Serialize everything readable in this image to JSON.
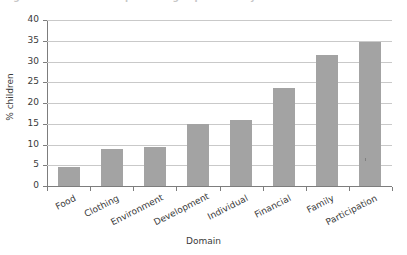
{
  "caption": {
    "text": "Figure: % of children experiencing deprivation by domain"
  },
  "chart_data": {
    "type": "bar",
    "title": "",
    "xlabel": "Domain",
    "ylabel": "% children",
    "categories": [
      "Food",
      "Clothing",
      "Environment",
      "Development",
      "Individual",
      "Financial",
      "Family",
      "Participation"
    ],
    "values": [
      4.5,
      9.0,
      9.3,
      15.0,
      15.8,
      23.5,
      31.5,
      34.6
    ],
    "ylim": [
      0,
      40
    ],
    "ytick_step": 5,
    "ytick_labels": [
      "0",
      "5",
      "10",
      "15",
      "20",
      "25",
      "30",
      "35",
      "40"
    ],
    "grid": "horizontal",
    "legend": "none",
    "bar_color": "#a3a3a3",
    "gridline_color": "#c9c9c9",
    "axis_color": "#7d7d7d",
    "background_color": "#ffffff",
    "text_color": "#3a3a3a"
  }
}
